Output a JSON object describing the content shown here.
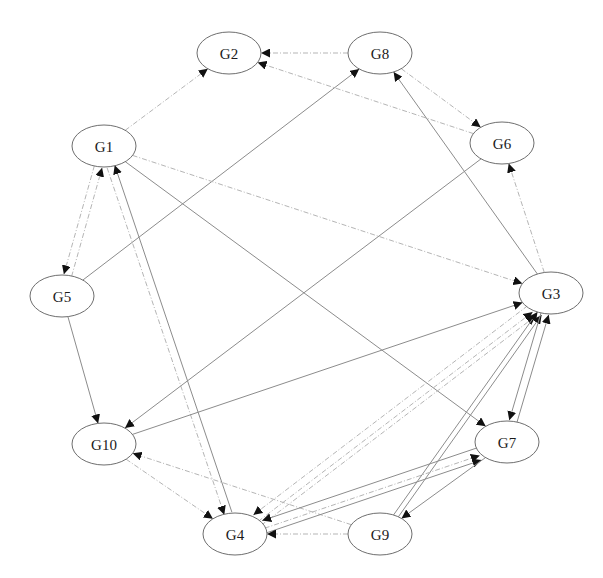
{
  "diagram": {
    "type": "directed-graph",
    "layout": "circular",
    "colors": {
      "background": "#ffffff",
      "node_stroke": "#6e6e6e",
      "node_fill": "#ffffff",
      "label": "#1a1a1a",
      "arrowhead": "#111111",
      "edge_solid": "#8c8c8c",
      "edge_dashed": "#b5b5b5"
    },
    "node_rx": 32,
    "node_ry": 21,
    "nodes": [
      {
        "id": "G1",
        "label": "G1",
        "x": 104,
        "y": 146
      },
      {
        "id": "G2",
        "label": "G2",
        "x": 229,
        "y": 53
      },
      {
        "id": "G3",
        "label": "G3",
        "x": 551,
        "y": 293
      },
      {
        "id": "G4",
        "label": "G4",
        "x": 235,
        "y": 534
      },
      {
        "id": "G5",
        "label": "G5",
        "x": 62,
        "y": 296
      },
      {
        "id": "G6",
        "label": "G6",
        "x": 502,
        "y": 143
      },
      {
        "id": "G7",
        "label": "G7",
        "x": 507,
        "y": 442
      },
      {
        "id": "G8",
        "label": "G8",
        "x": 380,
        "y": 53
      },
      {
        "id": "G9",
        "label": "G9",
        "x": 380,
        "y": 534
      },
      {
        "id": "G10",
        "label": "G10",
        "x": 104,
        "y": 444
      }
    ],
    "edges": [
      {
        "from": "G1",
        "to": "G2",
        "style": "dashed"
      },
      {
        "from": "G8",
        "to": "G2",
        "style": "dashed"
      },
      {
        "from": "G6",
        "to": "G2",
        "style": "dashed"
      },
      {
        "from": "G8",
        "to": "G6",
        "style": "dashed"
      },
      {
        "from": "G3",
        "to": "G8",
        "style": "solid"
      },
      {
        "from": "G5",
        "to": "G8",
        "style": "solid"
      },
      {
        "from": "G3",
        "to": "G6",
        "style": "dashed"
      },
      {
        "from": "G1",
        "to": "G3",
        "style": "dashed"
      },
      {
        "from": "G1",
        "to": "G7",
        "style": "solid"
      },
      {
        "from": "G5",
        "to": "G1",
        "style": "dashed"
      },
      {
        "from": "G1",
        "to": "G5",
        "style": "dashed"
      },
      {
        "from": "G4",
        "to": "G1",
        "style": "solid"
      },
      {
        "from": "G1",
        "to": "G4",
        "style": "dashed"
      },
      {
        "from": "G5",
        "to": "G10",
        "style": "solid"
      },
      {
        "from": "G6",
        "to": "G10",
        "style": "solid"
      },
      {
        "from": "G10",
        "to": "G3",
        "style": "solid"
      },
      {
        "from": "G9",
        "to": "G10",
        "style": "dashed"
      },
      {
        "from": "G10",
        "to": "G4",
        "style": "dashed"
      },
      {
        "from": "G4",
        "to": "G3",
        "style": "dashed"
      },
      {
        "from": "G4",
        "to": "G3",
        "style": "dashed",
        "offset": 1
      },
      {
        "from": "G9",
        "to": "G3",
        "style": "solid"
      },
      {
        "from": "G9",
        "to": "G3",
        "style": "solid",
        "offset": 1
      },
      {
        "from": "G7",
        "to": "G3",
        "style": "solid"
      },
      {
        "from": "G3",
        "to": "G7",
        "style": "solid"
      },
      {
        "from": "G4",
        "to": "G7",
        "style": "dashed"
      },
      {
        "from": "G4",
        "to": "G7",
        "style": "solid",
        "offset": 1
      },
      {
        "from": "G7",
        "to": "G4",
        "style": "solid"
      },
      {
        "from": "G3",
        "to": "G4",
        "style": "dashed"
      },
      {
        "from": "G9",
        "to": "G4",
        "style": "dashed"
      },
      {
        "from": "G7",
        "to": "G9",
        "style": "solid"
      }
    ]
  }
}
